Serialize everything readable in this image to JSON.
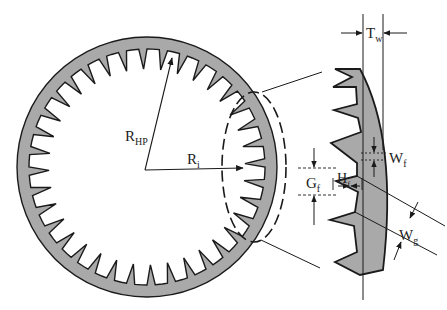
{
  "diagram": {
    "title": "",
    "colors": {
      "fill": "#a9a9a9",
      "stroke": "#1a1a1a",
      "background": "#ffffff"
    },
    "gear": {
      "type": "internal-toothed ring",
      "tooth_count": 36
    },
    "labels": {
      "r_hp": {
        "main": "R",
        "sub": "HP"
      },
      "r_i": {
        "main": "R",
        "sub": "i"
      },
      "t_w": {
        "main": "T",
        "sub": "w"
      },
      "w_f": {
        "main": "W",
        "sub": "f"
      },
      "g_f": {
        "main": "G",
        "sub": "f"
      },
      "h_f": {
        "main": "H",
        "sub": "f"
      },
      "w_g": {
        "main": "W",
        "sub": "g"
      }
    }
  }
}
